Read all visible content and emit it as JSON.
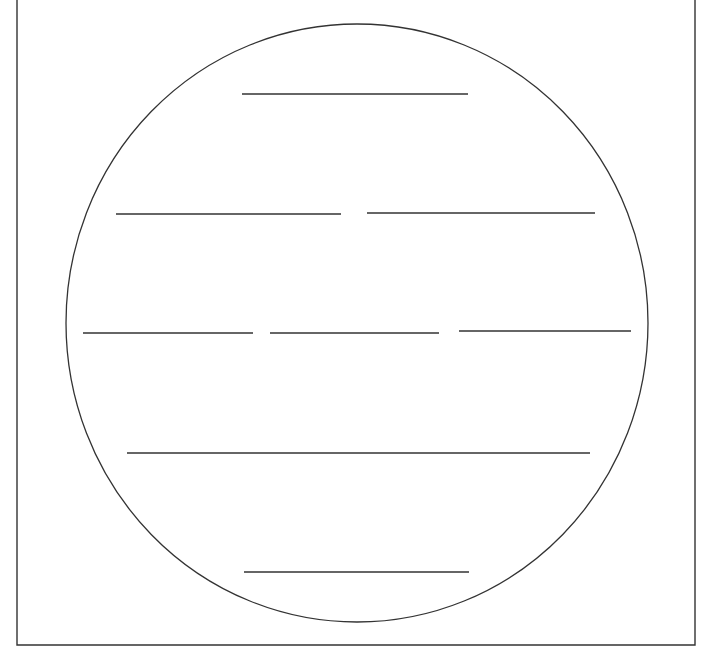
{
  "diagram": {
    "colors": {
      "stroke": "#333333",
      "background": "#ffffff"
    },
    "frame": {
      "left": 17,
      "right": 695,
      "bottom": 645,
      "top_open": true
    },
    "circle": {
      "cx": 357,
      "cy": 323,
      "rx": 291,
      "ry": 299
    },
    "rows": [
      {
        "lines": [
          {
            "x1": 242,
            "x2": 468,
            "y": 94
          }
        ]
      },
      {
        "lines": [
          {
            "x1": 116,
            "x2": 341,
            "y": 214
          },
          {
            "x1": 367,
            "x2": 595,
            "y": 213
          }
        ]
      },
      {
        "lines": [
          {
            "x1": 83,
            "x2": 253,
            "y": 333
          },
          {
            "x1": 270,
            "x2": 439,
            "y": 333
          },
          {
            "x1": 459,
            "x2": 631,
            "y": 331
          }
        ]
      },
      {
        "lines": [
          {
            "x1": 127,
            "x2": 590,
            "y": 453
          }
        ]
      },
      {
        "lines": [
          {
            "x1": 244,
            "x2": 469,
            "y": 572
          }
        ]
      }
    ]
  }
}
